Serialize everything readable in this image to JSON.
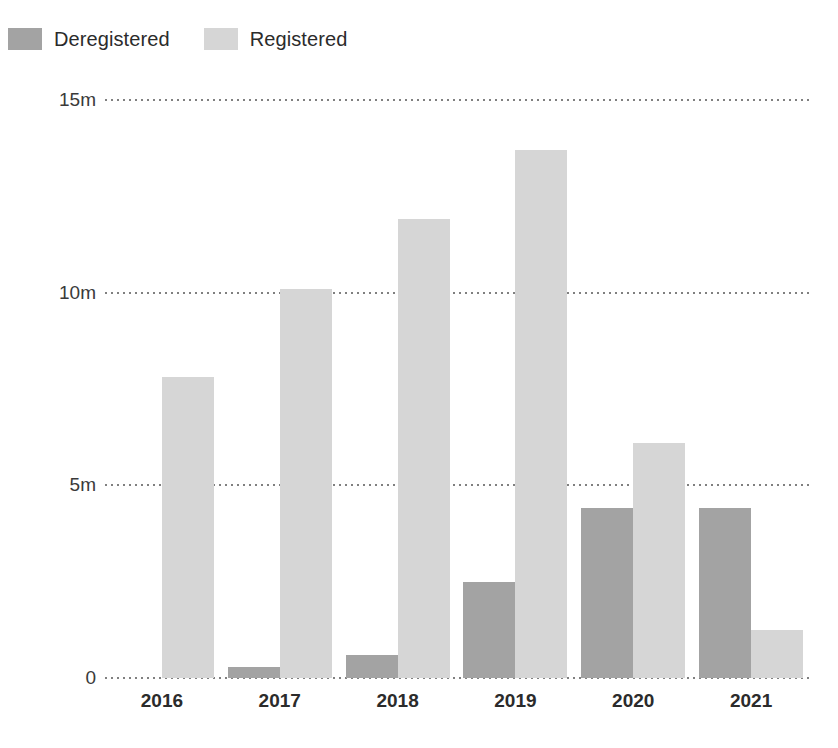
{
  "chart_data": {
    "type": "bar",
    "title": "",
    "subtitle": "",
    "xlabel": "",
    "ylabel": "",
    "categories": [
      "2016",
      "2017",
      "2018",
      "2019",
      "2020",
      "2021"
    ],
    "series": [
      {
        "name": "Deregistered",
        "color": "#a3a3a3",
        "values": [
          0,
          0.28,
          0.6,
          2.5,
          4.4,
          4.4
        ]
      },
      {
        "name": "Registered",
        "color": "#d6d6d6",
        "values": [
          7.8,
          10.1,
          11.9,
          13.7,
          6.1,
          1.25
        ]
      }
    ],
    "ylim": [
      0,
      15
    ],
    "yticks": [
      0,
      5,
      10,
      15
    ],
    "ytick_labels": [
      "0",
      "5m",
      "10m",
      "15m"
    ],
    "grid": "horizontal-dotted",
    "grid_color": "#808080",
    "legend_position": "top-left",
    "value_suffix": "m",
    "background": "#ffffff"
  },
  "legend": {
    "items": [
      {
        "label": "Deregistered",
        "color": "#a3a3a3"
      },
      {
        "label": "Registered",
        "color": "#d6d6d6"
      }
    ]
  },
  "axes": {
    "y": {
      "ticks": [
        {
          "label": "15m",
          "value": 15
        },
        {
          "label": "10m",
          "value": 10
        },
        {
          "label": "5m",
          "value": 5
        },
        {
          "label": "0",
          "value": 0
        }
      ]
    },
    "x": {
      "ticks": [
        "2016",
        "2017",
        "2018",
        "2019",
        "2020",
        "2021"
      ]
    }
  }
}
